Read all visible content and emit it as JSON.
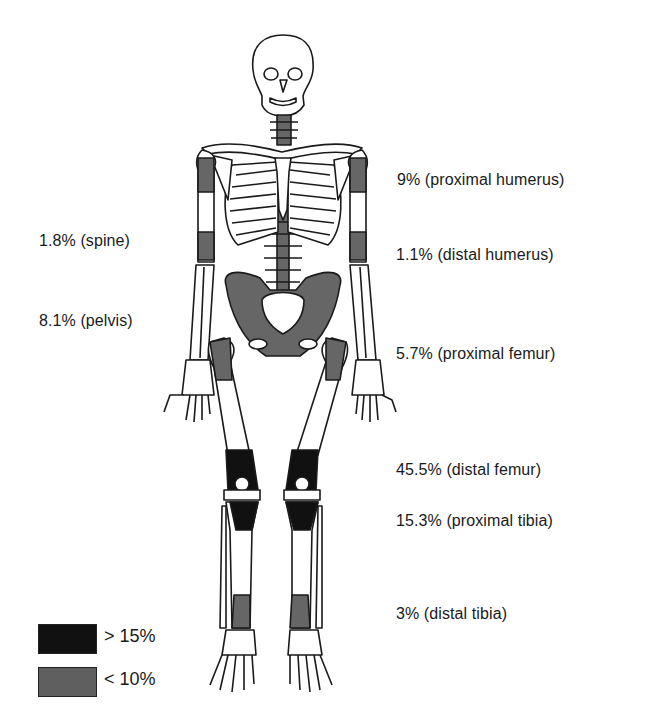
{
  "diagram": {
    "type": "anatomical-skeleton"
  },
  "colors": {
    "high": "#111111",
    "low": "#666666",
    "bone_fill": "#ffffff",
    "bone_outline": "#1a1a1a"
  },
  "labels": {
    "left": [
      {
        "id": "spine",
        "text": "1.8% (spine)",
        "percent": 1.8,
        "site": "spine"
      },
      {
        "id": "pelvis",
        "text": "8.1% (pelvis)",
        "percent": 8.1,
        "site": "pelvis"
      }
    ],
    "right": [
      {
        "id": "proximal-humerus",
        "text": "9% (proximal humerus)",
        "percent": 9,
        "site": "proximal humerus"
      },
      {
        "id": "distal-humerus",
        "text": "1.1% (distal humerus)",
        "percent": 1.1,
        "site": "distal humerus"
      },
      {
        "id": "proximal-femur",
        "text": "5.7% (proximal femur)",
        "percent": 5.7,
        "site": "proximal femur"
      },
      {
        "id": "distal-femur",
        "text": "45.5% (distal femur)",
        "percent": 45.5,
        "site": "distal femur"
      },
      {
        "id": "proximal-tibia",
        "text": "15.3% (proximal tibia)",
        "percent": 15.3,
        "site": "proximal tibia"
      },
      {
        "id": "distal-tibia",
        "text": "3% (distal tibia)",
        "percent": 3,
        "site": "distal tibia"
      }
    ]
  },
  "legend": {
    "items": [
      {
        "label": "> 15%",
        "shade": "black"
      },
      {
        "label": "< 10%",
        "shade": "gray"
      }
    ]
  }
}
